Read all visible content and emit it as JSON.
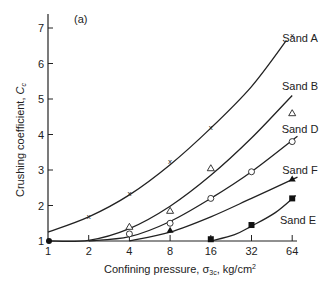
{
  "chart_data": {
    "type": "line",
    "panel_label": "(a)",
    "title": "",
    "xlabel": "Confining pressure, σ3c, kg/cm²",
    "xlabel_parts": {
      "main": "Confining pressure, σ",
      "sub": "3c",
      "unit": ", kg/cm",
      "sup": "2"
    },
    "ylabel": "Crushing coefficient, Cc",
    "ylabel_parts": {
      "main": "Crushing coefficient, ",
      "var": "C",
      "sub": "c"
    },
    "xscale": "log2",
    "x_ticks": [
      1,
      2,
      4,
      8,
      16,
      32,
      64
    ],
    "y_ticks": [
      1,
      2,
      3,
      4,
      5,
      6,
      7
    ],
    "xlim": [
      1,
      64
    ],
    "ylim": [
      1,
      7.5
    ],
    "grid": false,
    "legend_position": "inline labels at right end of curves",
    "origin_point": {
      "x": 1,
      "y": 1,
      "marker": "filled-circle"
    },
    "series": [
      {
        "name": "Sand A",
        "marker": "x",
        "points": [
          [
            2,
            1.7
          ],
          [
            4,
            2.35
          ],
          [
            8,
            3.25
          ],
          [
            16,
            4.2
          ],
          [
            64,
            6.8
          ]
        ],
        "curve": [
          [
            1,
            1.25
          ],
          [
            2,
            1.68
          ],
          [
            4,
            2.3
          ],
          [
            8,
            3.15
          ],
          [
            16,
            4.18
          ],
          [
            32,
            5.35
          ],
          [
            58,
            6.65
          ]
        ]
      },
      {
        "name": "Sand B",
        "marker": "open-triangle",
        "points": [
          [
            4,
            1.4
          ],
          [
            8,
            1.85
          ],
          [
            16,
            3.05
          ],
          [
            64,
            4.6
          ]
        ],
        "curve": [
          [
            1,
            1.0
          ],
          [
            2,
            1.02
          ],
          [
            4,
            1.35
          ],
          [
            8,
            1.98
          ],
          [
            16,
            2.85
          ],
          [
            32,
            3.9
          ],
          [
            64,
            5.1
          ]
        ]
      },
      {
        "name": "Sand D",
        "marker": "open-circle",
        "points": [
          [
            4,
            1.2
          ],
          [
            8,
            1.5
          ],
          [
            16,
            2.2
          ],
          [
            32,
            2.95
          ],
          [
            64,
            3.8
          ]
        ],
        "curve": [
          [
            2,
            1.0
          ],
          [
            4,
            1.12
          ],
          [
            8,
            1.55
          ],
          [
            16,
            2.2
          ],
          [
            32,
            2.95
          ],
          [
            70,
            3.95
          ]
        ]
      },
      {
        "name": "Sand F",
        "marker": "filled-triangle",
        "points": [
          [
            8,
            1.3
          ],
          [
            64,
            2.75
          ]
        ],
        "curve": [
          [
            4,
            1.0
          ],
          [
            8,
            1.25
          ],
          [
            16,
            1.68
          ],
          [
            32,
            2.2
          ],
          [
            70,
            2.8
          ]
        ]
      },
      {
        "name": "Sand E",
        "marker": "filled-square",
        "points": [
          [
            16,
            1.05
          ],
          [
            32,
            1.45
          ],
          [
            64,
            2.2
          ]
        ],
        "curve": [
          [
            16,
            1.0
          ],
          [
            24,
            1.18
          ],
          [
            32,
            1.42
          ],
          [
            48,
            1.8
          ],
          [
            68,
            2.28
          ]
        ]
      }
    ]
  }
}
